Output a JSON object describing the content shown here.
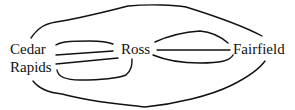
{
  "diagram": {
    "type": "multigraph",
    "nodes": [
      {
        "id": "cedar_rapids",
        "label_line1": "Cedar",
        "label_line2": "Rapids"
      },
      {
        "id": "ross",
        "label": "Ross"
      },
      {
        "id": "fairfield",
        "label": "Fairfield"
      }
    ],
    "edges": [
      {
        "from": "cedar_rapids",
        "to": "ross",
        "count": 4
      },
      {
        "from": "ross",
        "to": "fairfield",
        "count": 3
      },
      {
        "from": "cedar_rapids",
        "to": "fairfield",
        "count": 2
      }
    ],
    "stroke_color": "#111111",
    "background": "#ffffff"
  }
}
